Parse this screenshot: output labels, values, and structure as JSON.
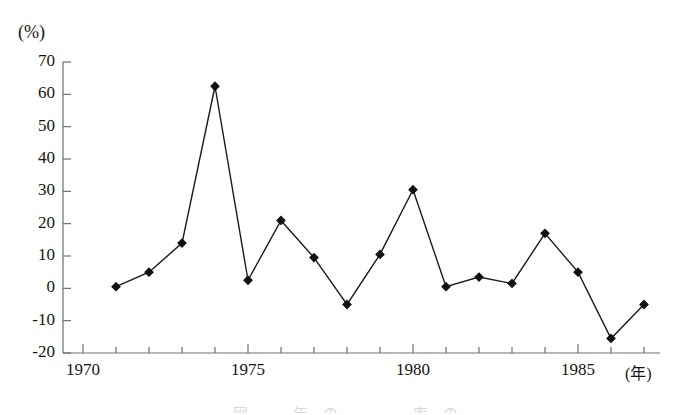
{
  "figure": {
    "y_axis_unit": "(%)",
    "x_axis_unit": "(年)",
    "caption_partial": "図　　　年　の　　　　　率　の　　　　　　　　　"
  },
  "axes": {
    "y_tick_labels": [
      "70",
      "60",
      "50",
      "40",
      "30",
      "20",
      "10",
      "0",
      "-10",
      "-20"
    ],
    "x_tick_labels": [
      "1970",
      "1975",
      "1980",
      "1985"
    ]
  },
  "chart_data": {
    "type": "line",
    "title": "",
    "xlabel": "(年)",
    "ylabel": "(%)",
    "xlim": [
      1970,
      1987.5
    ],
    "ylim": [
      -20,
      70
    ],
    "ytick_interval": 10,
    "xtick_major_interval": 5,
    "xtick_minor_interval": 1,
    "grid": false,
    "legend": null,
    "marker": "diamond",
    "line_color": "#1a1a1a",
    "marker_color": "#111111",
    "x": [
      1971,
      1972,
      1973,
      1974,
      1975,
      1976,
      1977,
      1978,
      1979,
      1980,
      1981,
      1982,
      1983,
      1984,
      1985,
      1986,
      1987
    ],
    "values": [
      0.5,
      5.0,
      14.0,
      62.5,
      2.5,
      21.0,
      9.5,
      -5.0,
      10.5,
      30.5,
      0.5,
      3.5,
      1.5,
      17.0,
      5.0,
      -15.5,
      -5.0
    ]
  }
}
